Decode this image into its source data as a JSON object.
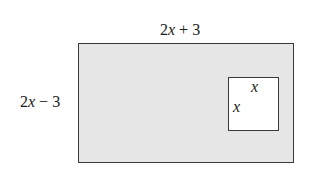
{
  "diagram": {
    "type": "geometry-area",
    "outer_rectangle": {
      "width_label": "2x + 3",
      "height_label": "2x − 3",
      "fill": "#e6e6e6",
      "stroke": "#3a3a3a"
    },
    "inner_square": {
      "side_label_top": "x",
      "side_label_left": "x",
      "fill": "#ffffff",
      "stroke": "#3a3a3a"
    }
  }
}
